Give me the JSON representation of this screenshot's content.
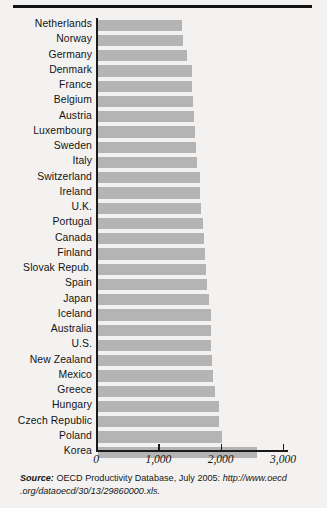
{
  "figure": {
    "top_rule": true
  },
  "chart_data": {
    "type": "bar",
    "orientation": "horizontal",
    "title": "",
    "xlabel": "",
    "ylabel": "",
    "xlim": [
      0,
      3000
    ],
    "grid": false,
    "legend": null,
    "bar_color": "#b4b4b4",
    "axis_color": "#1a1a1a",
    "tick_labels": [
      "0",
      "1,000",
      "2,000",
      "3,000"
    ],
    "tick_values": [
      0,
      1000,
      2000,
      3000
    ],
    "categories": [
      "Netherlands",
      "Norway",
      "Germany",
      "Denmark",
      "France",
      "Belgium",
      "Austria",
      "Luxembourg",
      "Sweden",
      "Italy",
      "Switzerland",
      "Ireland",
      "U.K.",
      "Portugal",
      "Canada",
      "Finland",
      "Slovak Repub.",
      "Spain",
      "Japan",
      "Iceland",
      "Australia",
      "U.S.",
      "New Zealand",
      "Mexico",
      "Greece",
      "Hungary",
      "Czech Republic",
      "Poland",
      "Korea"
    ],
    "values": [
      1340,
      1360,
      1420,
      1500,
      1500,
      1520,
      1540,
      1560,
      1580,
      1590,
      1640,
      1640,
      1660,
      1680,
      1700,
      1720,
      1730,
      1750,
      1780,
      1810,
      1810,
      1820,
      1830,
      1850,
      1880,
      1940,
      1940,
      1990,
      2550
    ]
  },
  "source": {
    "label": "Source:",
    "line1": " OECD Productivity Database, July 2005: ",
    "url1": "http://www.oecd",
    "url2": ".org/dataoecd/30/13/29860000.xls."
  }
}
